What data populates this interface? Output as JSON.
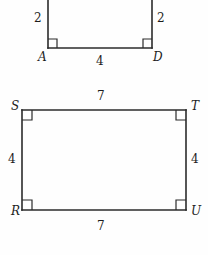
{
  "figure": {
    "type": "geometry-diagram",
    "background_color": "#fefefe",
    "line_color": "#2b2b2b",
    "shapes": [
      {
        "name": "top-figure",
        "description": "partial rectangle clipped by the top edge of the image",
        "vertices": [
          {
            "label": "A",
            "position": "bottom-left",
            "right_angle": true
          },
          {
            "label": "D",
            "position": "bottom-right",
            "right_angle": true
          }
        ],
        "side_labels": {
          "left": "2",
          "right": "2",
          "bottom": "4"
        }
      },
      {
        "name": "rectangle-STUR",
        "description": "complete rectangle with vertices S, T, U, R",
        "vertices": [
          {
            "label": "S",
            "position": "top-left",
            "right_angle": true
          },
          {
            "label": "T",
            "position": "top-right",
            "right_angle": true
          },
          {
            "label": "U",
            "position": "bottom-right",
            "right_angle": true
          },
          {
            "label": "R",
            "position": "bottom-left",
            "right_angle": true
          }
        ],
        "side_labels": {
          "top": "7",
          "bottom": "7",
          "left": "4",
          "right": "4"
        }
      }
    ]
  }
}
